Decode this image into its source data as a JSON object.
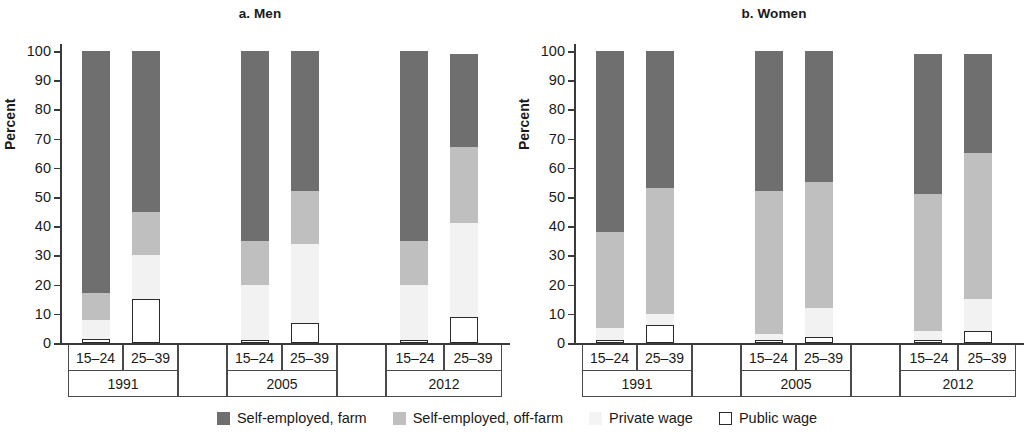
{
  "figure": {
    "ylabel": "Percent",
    "legend": [
      {
        "key": "farm",
        "label": "Self-employed, farm",
        "color": "#6f6f6f",
        "icon": "filled-square-dark-icon"
      },
      {
        "key": "offfarm",
        "label": "Self-employed, off-farm",
        "color": "#bfbfbf",
        "icon": "filled-square-medium-icon"
      },
      {
        "key": "private",
        "label": "Private wage",
        "color": "#f4f4f4",
        "icon": "filled-square-light-icon"
      },
      {
        "key": "public",
        "label": "Public wage",
        "color": "#ffffff",
        "icon": "outlined-square-icon"
      }
    ]
  },
  "panels": [
    {
      "id": "men",
      "title": "a. Men"
    },
    {
      "id": "women",
      "title": "b. Women"
    }
  ],
  "axis": {
    "yticks": [
      "0",
      "10",
      "20",
      "30",
      "40",
      "50",
      "60",
      "70",
      "80",
      "90",
      "100"
    ],
    "ages": [
      "15–24",
      "25–39"
    ],
    "years": [
      "1991",
      "2005",
      "2012"
    ]
  },
  "chart_data": {
    "type": "bar",
    "subtype": "stacked-bar",
    "xlabel": "",
    "ylabel": "Percent",
    "ylim": [
      0,
      100
    ],
    "yticks": [
      0,
      10,
      20,
      30,
      40,
      50,
      60,
      70,
      80,
      90,
      100
    ],
    "grid": false,
    "legend_position": "bottom",
    "series_names": [
      "Self-employed, farm",
      "Self-employed, off-farm",
      "Private wage",
      "Public wage"
    ],
    "series_colors": [
      "#6f6f6f",
      "#bfbfbf",
      "#f4f4f4",
      "#ffffff"
    ],
    "panels": [
      {
        "name": "a. Men",
        "categories": [
          {
            "year": "1991",
            "age": "15–24"
          },
          {
            "year": "1991",
            "age": "25–39"
          },
          {
            "year": "2005",
            "age": "15–24"
          },
          {
            "year": "2005",
            "age": "25–39"
          },
          {
            "year": "2012",
            "age": "15–24"
          },
          {
            "year": "2012",
            "age": "25–39"
          }
        ],
        "series": [
          {
            "name": "Self-employed, farm",
            "values": [
              83,
              55,
              65,
              48,
              65,
              32
            ]
          },
          {
            "name": "Self-employed, off-farm",
            "values": [
              9,
              15,
              15,
              18,
              15,
              26
            ]
          },
          {
            "name": "Private wage",
            "values": [
              6.5,
              15,
              19,
              27,
              19,
              32
            ]
          },
          {
            "name": "Public wage",
            "values": [
              1.5,
              15,
              1,
              7,
              1,
              9
            ]
          }
        ]
      },
      {
        "name": "b. Women",
        "categories": [
          {
            "year": "1991",
            "age": "15–24"
          },
          {
            "year": "1991",
            "age": "25–39"
          },
          {
            "year": "2005",
            "age": "15–24"
          },
          {
            "year": "2005",
            "age": "25–39"
          },
          {
            "year": "2012",
            "age": "15–24"
          },
          {
            "year": "2012",
            "age": "25–39"
          }
        ],
        "series": [
          {
            "name": "Self-employed, farm",
            "values": [
              62,
              47,
              48,
              45,
              48,
              34
            ]
          },
          {
            "name": "Self-employed, off-farm",
            "values": [
              33,
              43,
              49,
              43,
              47,
              50
            ]
          },
          {
            "name": "Private wage",
            "values": [
              4,
              4,
              2,
              10,
              3,
              11
            ]
          },
          {
            "name": "Public wage",
            "values": [
              1,
              6,
              1,
              2,
              1,
              4
            ]
          }
        ]
      }
    ]
  }
}
